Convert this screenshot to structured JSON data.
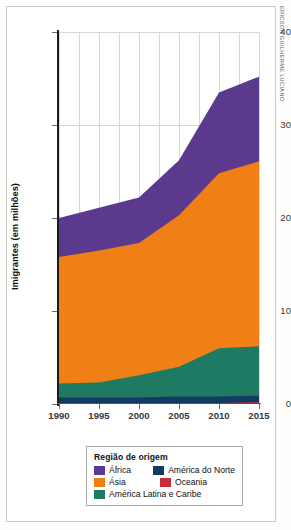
{
  "credit": "ERICSON GUILHERME LUCIANO",
  "axes": {
    "ylabel": "Imigrantes (em milhões)",
    "yticks": [
      "0",
      "10",
      "20",
      "30",
      "40"
    ],
    "xticks": [
      "1990",
      "1995",
      "2000",
      "2005",
      "2010",
      "2015"
    ]
  },
  "legend": {
    "title": "Região de origem",
    "entries": [
      {
        "label": "África",
        "color": "#5b3a8e"
      },
      {
        "label": "América do Norte",
        "color": "#123a63"
      },
      {
        "label": "Ásia",
        "color": "#f07f16"
      },
      {
        "label": "Oceania",
        "color": "#cc2b3c"
      },
      {
        "label": "América Latina e Caribe",
        "color": "#1f7a63"
      }
    ]
  },
  "chart_data": {
    "type": "area",
    "stacked": true,
    "title": "",
    "xlabel": "",
    "ylabel": "Imigrantes (em milhões)",
    "x": [
      1990,
      1995,
      2000,
      2005,
      2010,
      2015
    ],
    "xlim": [
      1990,
      2015
    ],
    "ylim": [
      0,
      40
    ],
    "yticks": [
      0,
      10,
      20,
      30,
      40
    ],
    "grid": "vertical gridlines every 2.5 years; horizontal gridlines at 30 and 40",
    "legend_position": "below-plot",
    "series": [
      {
        "name": "Oceania",
        "color": "#cc2b3c",
        "values": [
          0.1,
          0.1,
          0.1,
          0.1,
          0.1,
          0.2
        ]
      },
      {
        "name": "América do Norte",
        "color": "#123a63",
        "values": [
          0.6,
          0.6,
          0.6,
          0.7,
          0.7,
          0.7
        ]
      },
      {
        "name": "América Latina e Caribe",
        "color": "#1f7a63",
        "values": [
          1.5,
          1.6,
          2.4,
          3.2,
          5.2,
          5.3
        ]
      },
      {
        "name": "Ásia",
        "color": "#f07f16",
        "values": [
          13.6,
          14.2,
          14.2,
          16.3,
          18.8,
          19.9
        ]
      },
      {
        "name": "África",
        "color": "#5b3a8e",
        "values": [
          4.2,
          4.6,
          4.9,
          5.9,
          8.7,
          9.1
        ]
      }
    ],
    "cumulative_totals": [
      20.0,
      21.1,
      22.2,
      26.2,
      33.5,
      35.2
    ]
  }
}
